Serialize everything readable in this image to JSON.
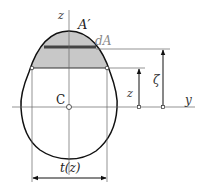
{
  "diagram": {
    "labels": {
      "z_axis": "z",
      "area_label": "A′",
      "strip_label": "dA",
      "z_dim": "z",
      "zeta_dim": "ζ",
      "y_axis": "y",
      "centroid": "C",
      "width": "t(z)"
    },
    "colors": {
      "outline": "#111111",
      "shaded_area": "#c8c8c8",
      "strip": "#444444",
      "axis": "#666666",
      "dA_text": "#888888"
    }
  }
}
